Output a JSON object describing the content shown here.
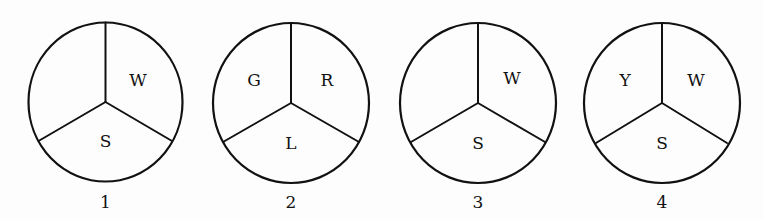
{
  "figures": [
    {
      "number": "1",
      "center": [
        105,
        102
      ],
      "radius": [
        77,
        79
      ],
      "sectors": {
        "upper_left": "",
        "upper_right": "W",
        "bottom": "S"
      }
    },
    {
      "number": "2",
      "center": [
        291,
        103
      ],
      "radius": [
        78,
        80
      ],
      "sectors": {
        "upper_left": "G",
        "upper_right": "R",
        "bottom": "L"
      }
    },
    {
      "number": "3",
      "center": [
        478,
        103
      ],
      "radius": [
        78,
        80
      ],
      "sectors": {
        "upper_left": "",
        "upper_right": "W",
        "bottom": "S"
      }
    },
    {
      "number": "4",
      "center": [
        662,
        103
      ],
      "radius": [
        78,
        80
      ],
      "sectors": {
        "upper_left": "Y",
        "upper_right": "W",
        "bottom": "S"
      }
    }
  ],
  "colors": {
    "background": "#fdfdfd",
    "stroke": "#111111"
  }
}
